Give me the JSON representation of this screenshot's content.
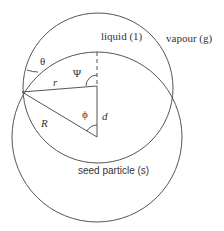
{
  "labels": {
    "liquid": "liquid (1)",
    "vapour": "vapour (g)",
    "seed": "seed particle (s)",
    "theta": "θ",
    "psi": "Ψ",
    "phi": "ϕ",
    "r": "r",
    "R": "R",
    "d": "d"
  },
  "colors": {
    "stroke": "#555555",
    "text": "#333333"
  }
}
